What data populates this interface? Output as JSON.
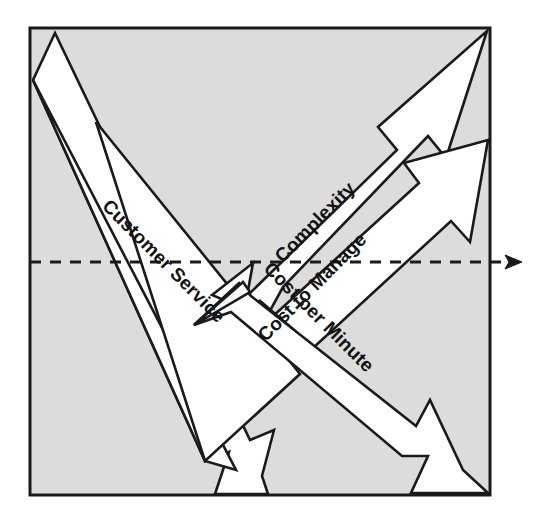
{
  "diagram": {
    "type": "arrow-diagram",
    "background_color": "#ffffff",
    "panel": {
      "name": "plot-panel",
      "fill_color": "#dcdcdc",
      "stroke_color": "#1a1a1a",
      "bounds": {
        "x": 30,
        "y": 28,
        "width": 460,
        "height": 467
      }
    },
    "arrow_style": {
      "fill_color": "#ffffff",
      "stroke_color": "#1a1a1a",
      "stroke_width": 2.4,
      "head_style": "notched-barb",
      "tail_style": "tapered"
    },
    "axis": {
      "name": "horizontal-axis",
      "style": "dashed",
      "color": "#1a1a1a",
      "dash_pattern": "11 9",
      "y": 262,
      "x_start": 30,
      "x_end": 512,
      "arrowhead": "right"
    },
    "arrows": [
      {
        "id": "complexity",
        "label": "Complexity",
        "direction": "up-right",
        "angle_deg": -45,
        "label_x": 316,
        "label_y": 223,
        "from": "center",
        "to": "top-right-corner",
        "meaning": "increasing"
      },
      {
        "id": "cost-to-manage",
        "label": "Cost to Manage",
        "direction": "up-right",
        "angle_deg": -45,
        "label_x": 310,
        "label_y": 290,
        "from": "center",
        "to": "right-upper-edge",
        "meaning": "increasing"
      },
      {
        "id": "cost-per-minute",
        "label": "Cost per Minute",
        "direction": "down-right",
        "angle_deg": 45,
        "label_x": 311,
        "label_y": 312,
        "from": "center",
        "to": "bottom-right-corner",
        "meaning": "decreasing"
      },
      {
        "id": "customer-service",
        "label": "Customer Service",
        "direction": "down-right",
        "angle_deg": 45,
        "label_x": 126,
        "label_y": 213,
        "from": "top-left-corner",
        "to": "bottom-center",
        "meaning": "decreasing"
      }
    ]
  }
}
